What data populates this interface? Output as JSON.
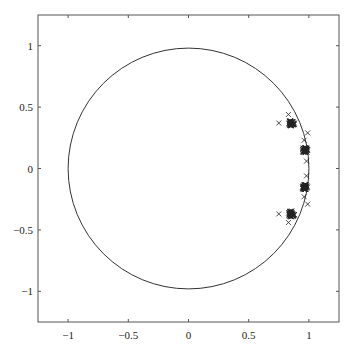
{
  "chart_data": {
    "type": "scatter",
    "title": "",
    "xlabel": "",
    "ylabel": "",
    "xlim": [
      -1.25,
      1.25
    ],
    "ylim": [
      -1.25,
      1.25
    ],
    "grid": false,
    "legend": null,
    "x_ticks": [
      -1,
      -0.5,
      0,
      0.5,
      1
    ],
    "x_tick_labels": [
      "−1",
      "−0.5",
      "0",
      "0.5",
      "1"
    ],
    "y_ticks": [
      1,
      0.5,
      0,
      -0.5,
      -1
    ],
    "y_tick_labels": [
      "1",
      "0.5",
      "0",
      "−0.5",
      "−1"
    ],
    "reference_curve": {
      "shape": "unit-circle",
      "center": [
        0,
        0
      ],
      "radius": 1
    },
    "marker": "x",
    "clusters": [
      {
        "center": [
          0.855,
          0.37
        ],
        "spread": 0.025,
        "count": 40
      },
      {
        "center": [
          0.965,
          0.15
        ],
        "spread": 0.022,
        "count": 40
      },
      {
        "center": [
          0.965,
          -0.15
        ],
        "spread": 0.022,
        "count": 40
      },
      {
        "center": [
          0.855,
          -0.37
        ],
        "spread": 0.025,
        "count": 40
      }
    ],
    "outliers": [
      {
        "x": 0.83,
        "y": 0.44
      },
      {
        "x": 0.75,
        "y": 0.37
      },
      {
        "x": 0.99,
        "y": 0.29
      },
      {
        "x": 0.96,
        "y": 0.23
      },
      {
        "x": 0.98,
        "y": 0.06
      },
      {
        "x": 0.98,
        "y": -0.06
      },
      {
        "x": 0.96,
        "y": -0.23
      },
      {
        "x": 0.99,
        "y": -0.29
      },
      {
        "x": 0.75,
        "y": -0.37
      },
      {
        "x": 0.83,
        "y": -0.44
      }
    ]
  },
  "colors": {
    "axes": "#555555",
    "curve": "#333333",
    "markers": "#222222"
  }
}
